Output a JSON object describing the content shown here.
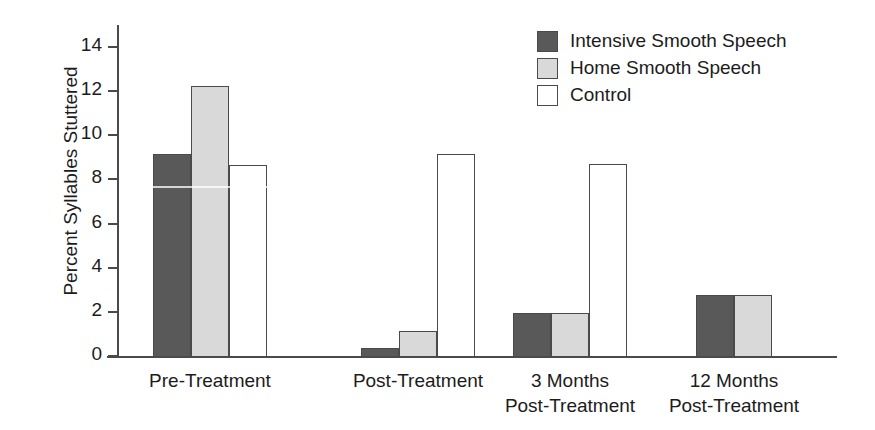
{
  "chart_data": {
    "type": "bar",
    "title": "",
    "xlabel": "",
    "ylabel": "Percent Syllables Stuttered",
    "ylim": [
      0,
      15
    ],
    "yticks": [
      0,
      2,
      4,
      6,
      8,
      10,
      12,
      14
    ],
    "grid": false,
    "legend_position": "top-right",
    "categories": [
      "Pre-Treatment",
      "Post-Treatment",
      "3 Months\nPost-Treatment",
      "12 Months\nPost-Treatment"
    ],
    "category_lines": [
      [
        "Pre-Treatment"
      ],
      [
        "Post-Treatment"
      ],
      [
        "3 Months",
        "Post-Treatment"
      ],
      [
        "12 Months",
        "Post-Treatment"
      ]
    ],
    "series": [
      {
        "name": "Intensive Smooth Speech",
        "color": "#595959",
        "values": [
          9.2,
          0.4,
          2.0,
          2.8
        ]
      },
      {
        "name": "Home Smooth Speech",
        "color": "#d9d9d9",
        "values": [
          12.3,
          1.2,
          2.0,
          2.8
        ]
      },
      {
        "name": "Control",
        "color": "#ffffff",
        "values": [
          8.7,
          9.2,
          8.75,
          null
        ]
      }
    ]
  },
  "axis": {
    "y_title": "Percent Syllables Stuttered",
    "y_tick_labels": [
      "14",
      "12",
      "10",
      "8",
      "6",
      "4",
      "2",
      "0"
    ]
  },
  "legend": {
    "items": [
      {
        "label": "Intensive Smooth Speech",
        "color": "#595959"
      },
      {
        "label": "Home Smooth Speech",
        "color": "#d9d9d9"
      },
      {
        "label": "Control",
        "color": "#ffffff"
      }
    ]
  },
  "colors": {
    "intensive": "#595959",
    "home": "#d9d9d9",
    "control": "#ffffff",
    "axis": "#4a4a4a",
    "text": "#1c1c1c",
    "background": "#ffffff"
  }
}
